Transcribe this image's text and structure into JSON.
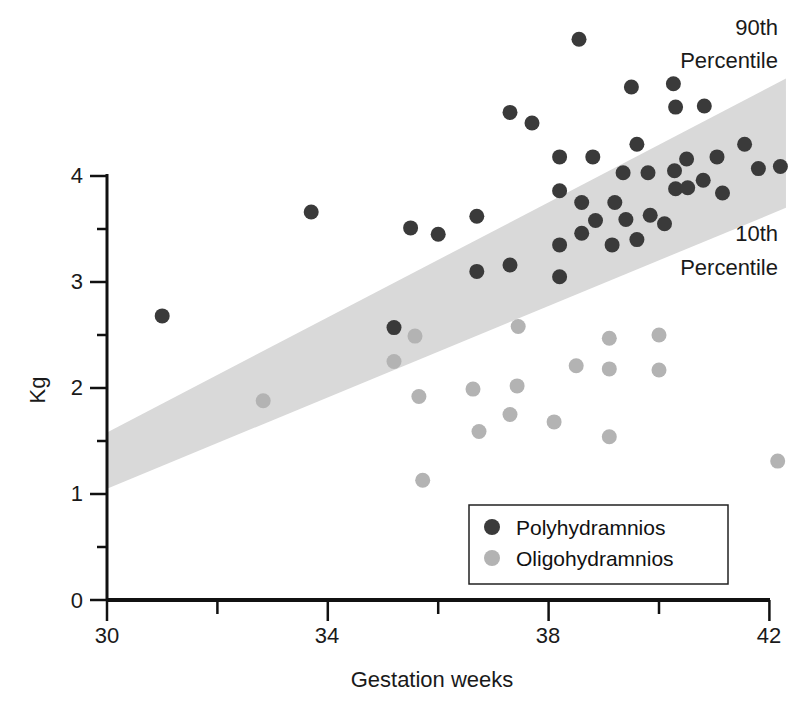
{
  "chart_data": {
    "type": "scatter",
    "title": "",
    "xlabel": "Gestation weeks",
    "ylabel": "Kg",
    "xlim": [
      30,
      42
    ],
    "ylim": [
      0,
      4
    ],
    "x_ticks": [
      30,
      34,
      38,
      42
    ],
    "x_minor_ticks": [
      32,
      36,
      40
    ],
    "y_ticks": [
      0,
      1,
      2,
      3,
      4
    ],
    "y_minor_ticks": [
      0.5,
      1.5,
      2.5,
      3.5
    ],
    "grid": false,
    "legend_position": "lower right",
    "band": {
      "name": "10th-90th percentile range",
      "color": "#d9d9d9",
      "upper": [
        {
          "x": 30,
          "y": 1.58
        },
        {
          "x": 42.3,
          "y": 4.92
        }
      ],
      "lower": [
        {
          "x": 30,
          "y": 1.05
        },
        {
          "x": 42.3,
          "y": 3.7
        }
      ]
    },
    "annotations": [
      {
        "text": "90th",
        "text2": "Percentile",
        "x": 42.3,
        "y": 5.3
      },
      {
        "text": "10th",
        "text2": "Percentile",
        "x": 42.3,
        "y": 3.2
      }
    ],
    "series": [
      {
        "name": "Polyhydramnios",
        "color": "#3a3a3a",
        "points": [
          [
            31.0,
            2.68
          ],
          [
            33.7,
            3.66
          ],
          [
            35.2,
            2.57
          ],
          [
            35.5,
            3.51
          ],
          [
            36.0,
            3.45
          ],
          [
            36.7,
            3.62
          ],
          [
            36.7,
            3.1
          ],
          [
            37.3,
            4.6
          ],
          [
            37.3,
            3.16
          ],
          [
            37.7,
            4.5
          ],
          [
            38.2,
            4.18
          ],
          [
            38.2,
            3.86
          ],
          [
            38.2,
            3.35
          ],
          [
            38.2,
            3.05
          ],
          [
            38.55,
            5.29
          ],
          [
            38.6,
            3.75
          ],
          [
            38.6,
            3.46
          ],
          [
            38.8,
            4.18
          ],
          [
            38.85,
            3.58
          ],
          [
            39.15,
            3.35
          ],
          [
            39.2,
            3.75
          ],
          [
            39.35,
            4.03
          ],
          [
            39.4,
            3.59
          ],
          [
            39.5,
            4.84
          ],
          [
            39.6,
            4.3
          ],
          [
            39.6,
            3.4
          ],
          [
            39.8,
            4.03
          ],
          [
            39.84,
            3.63
          ],
          [
            40.1,
            3.55
          ],
          [
            40.26,
            4.87
          ],
          [
            40.28,
            4.05
          ],
          [
            40.3,
            3.88
          ],
          [
            40.5,
            4.16
          ],
          [
            40.52,
            3.89
          ],
          [
            40.3,
            4.65
          ],
          [
            40.8,
            3.96
          ],
          [
            41.05,
            4.18
          ],
          [
            41.15,
            3.84
          ],
          [
            40.82,
            4.66
          ],
          [
            41.55,
            4.3
          ],
          [
            41.8,
            4.07
          ],
          [
            42.2,
            4.09
          ]
        ]
      },
      {
        "name": "Oligohydramnios",
        "color": "#b3b3b3",
        "points": [
          [
            32.83,
            1.88
          ],
          [
            35.2,
            2.25
          ],
          [
            35.58,
            2.49
          ],
          [
            35.65,
            1.92
          ],
          [
            35.72,
            1.13
          ],
          [
            36.63,
            1.99
          ],
          [
            36.74,
            1.59
          ],
          [
            37.3,
            1.75
          ],
          [
            37.43,
            2.02
          ],
          [
            37.45,
            2.58
          ],
          [
            38.1,
            1.68
          ],
          [
            38.5,
            2.21
          ],
          [
            39.1,
            2.47
          ],
          [
            39.1,
            2.18
          ],
          [
            39.1,
            1.54
          ],
          [
            40.0,
            2.5
          ],
          [
            40.0,
            2.17
          ],
          [
            42.15,
            1.31
          ]
        ]
      }
    ]
  },
  "labels": {
    "x_axis_title": "Gestation weeks",
    "y_axis_title": "Kg",
    "x_tick_30": "30",
    "x_tick_34": "34",
    "x_tick_38": "38",
    "x_tick_42": "42",
    "y_tick_0": "0",
    "y_tick_1": "1",
    "y_tick_2": "2",
    "y_tick_3": "3",
    "y_tick_4": "4",
    "annot_90_line1": "90th",
    "annot_90_line2": "Percentile",
    "annot_10_line1": "10th",
    "annot_10_line2": "Percentile",
    "legend_poly": "Polyhydramnios",
    "legend_oligo": "Oligohydramnios"
  }
}
